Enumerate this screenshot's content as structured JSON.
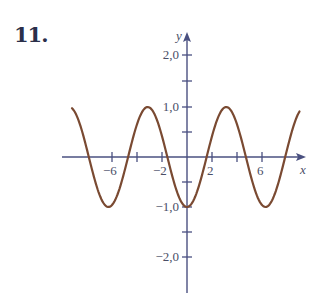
{
  "problem": {
    "number": "11."
  },
  "colors": {
    "axis": "#4a5080",
    "curve": "#7a4a32",
    "text": "#4a4e66"
  },
  "chart_data": {
    "type": "line",
    "title": "",
    "function": "y = -cos(x)",
    "xlabel": "x",
    "ylabel": "y",
    "xlim": [
      -9.2,
      9.0
    ],
    "ylim": [
      -2.0,
      2.0
    ],
    "x_ticks": [
      -6,
      -4,
      -2,
      0,
      2,
      4,
      6
    ],
    "x_tick_labels": [
      "-6",
      "",
      "-2",
      "",
      "2",
      "",
      "6"
    ],
    "y_ticks": [
      -2.0,
      -1.5,
      -1.0,
      -0.5,
      0.5,
      1.0,
      1.5,
      2.0
    ],
    "y_tick_labels": [
      "-2,0",
      "",
      "-1,0",
      "",
      "",
      "1,0",
      "",
      "2,0"
    ],
    "grid": false,
    "series": [
      {
        "name": "y = -cos(x)",
        "key_points": [
          {
            "x": -9.2,
            "y": 0.98
          },
          {
            "x": -7.85,
            "y": 0
          },
          {
            "x": -6.28,
            "y": -1
          },
          {
            "x": -4.71,
            "y": 0
          },
          {
            "x": -3.14,
            "y": 1
          },
          {
            "x": -1.57,
            "y": 0
          },
          {
            "x": 0,
            "y": -1
          },
          {
            "x": 1.57,
            "y": 0
          },
          {
            "x": 3.14,
            "y": 1
          },
          {
            "x": 4.71,
            "y": 0
          },
          {
            "x": 6.28,
            "y": -1
          },
          {
            "x": 7.85,
            "y": 0
          },
          {
            "x": 9.0,
            "y": 0.91
          }
        ]
      }
    ]
  },
  "labels": {
    "x_axis": "x",
    "y_axis": "y",
    "x_neg6": "−6",
    "x_neg2": "−2",
    "x_pos2": "2",
    "x_pos6": "6",
    "y_pos2": "2,0",
    "y_pos1": "1,0",
    "y_neg1": "−1,0",
    "y_neg2": "−2,0"
  }
}
